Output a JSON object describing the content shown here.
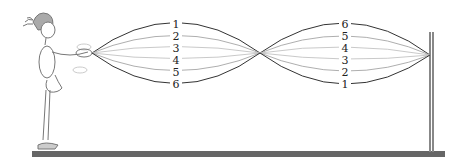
{
  "diagram": {
    "type": "standing-wave-on-rope",
    "left_loop_labels": [
      "1",
      "2",
      "3",
      "4",
      "5",
      "6"
    ],
    "right_loop_labels": [
      "6",
      "5",
      "4",
      "3",
      "2",
      "1"
    ],
    "colors": {
      "rope_dark": "#333333",
      "rope_light": "#9a9a9a",
      "ground": "#666666",
      "post": "#888888",
      "hat": "#999999"
    }
  }
}
